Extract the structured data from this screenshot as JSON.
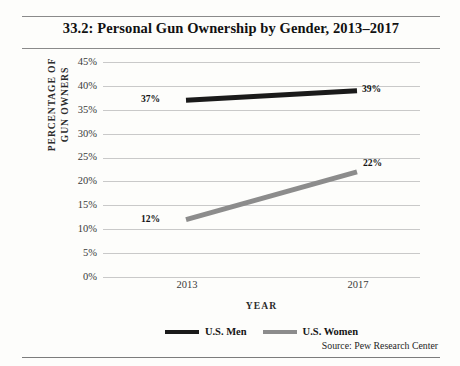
{
  "figure": {
    "title": "33.2: Personal Gun Ownership by Gender, 2013–2017",
    "source": "Source: Pew Research Center"
  },
  "chart_data": {
    "type": "line",
    "title": "33.2: Personal Gun Ownership by Gender, 2013–2017",
    "xlabel": "YEAR",
    "ylabel": "PERCENTAGE OF GUN OWNERS",
    "ylabel_line1": "PERCENTAGE OF",
    "ylabel_line2": "GUN OWNERS",
    "categories": [
      "2013",
      "2017"
    ],
    "x": [
      2013,
      2017
    ],
    "ylim": [
      0,
      45
    ],
    "yticks": [
      45,
      40,
      35,
      30,
      25,
      20,
      15,
      10,
      5,
      0
    ],
    "ytick_labels": [
      "45%",
      "40%",
      "35%",
      "30%",
      "25%",
      "20%",
      "15%",
      "10%",
      "5%",
      "0%"
    ],
    "grid": true,
    "legend_position": "bottom-center",
    "series": [
      {
        "name": "U.S. Men",
        "color": "#1a1a1a",
        "values": [
          37,
          39
        ],
        "point_labels": [
          "37%",
          "39%"
        ]
      },
      {
        "name": "U.S. Women",
        "color": "#8c8c8c",
        "values": [
          12,
          22
        ],
        "point_labels": [
          "12%",
          "22%"
        ]
      }
    ],
    "annotations": [
      {
        "text": "37%",
        "series": "U.S. Men",
        "x": "2013",
        "y": 37
      },
      {
        "text": "39%",
        "series": "U.S. Men",
        "x": "2017",
        "y": 39
      },
      {
        "text": "12%",
        "series": "U.S. Women",
        "x": "2013",
        "y": 12
      },
      {
        "text": "22%",
        "series": "U.S. Women",
        "x": "2017",
        "y": 22
      }
    ],
    "colors": {
      "men_line": "#1a1a1a",
      "women_line": "#8c8c8c",
      "gridline": "#c9c9c9",
      "rule": "#8a8a8a",
      "background": "#fdfdfb"
    }
  }
}
